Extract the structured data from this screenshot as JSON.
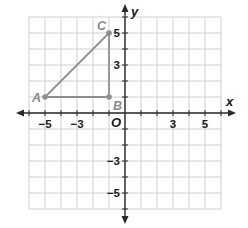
{
  "figure": {
    "type": "coordinate-plane",
    "grid": {
      "x_min": -6,
      "x_max": 6,
      "y_min": -6,
      "y_max": 6,
      "unit": 1
    },
    "axes": {
      "x_label": "x",
      "y_label": "y",
      "origin_label": "O",
      "x_tick_labels": [
        {
          "value": -5,
          "text": "−5"
        },
        {
          "value": -3,
          "text": "−3"
        },
        {
          "value": 3,
          "text": "3"
        },
        {
          "value": 5,
          "text": "5"
        }
      ],
      "y_tick_labels": [
        {
          "value": 5,
          "text": "5"
        },
        {
          "value": 3,
          "text": "3"
        },
        {
          "value": -3,
          "text": "−3"
        },
        {
          "value": -5,
          "text": "−5"
        }
      ]
    },
    "points": [
      {
        "name": "A",
        "x": -5,
        "y": 1
      },
      {
        "name": "B",
        "x": -1,
        "y": 1
      },
      {
        "name": "C",
        "x": -1,
        "y": 5
      }
    ],
    "segments": [
      [
        "A",
        "B"
      ],
      [
        "B",
        "C"
      ],
      [
        "C",
        "A"
      ]
    ],
    "colors": {
      "shape": "#8f8f8f",
      "grid": "#cfcfcf",
      "axis": "#2a2a2a"
    }
  }
}
